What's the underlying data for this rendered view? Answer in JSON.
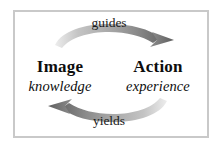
{
  "figure": {
    "type": "cycle-diagram",
    "background_color": "#ffffff",
    "frame": {
      "border_color": "#c9c9c9",
      "fill_color": "#ffffff"
    },
    "nodes": [
      {
        "id": "image",
        "title": "Image",
        "subtitle": "knowledge",
        "position": "left"
      },
      {
        "id": "action",
        "title": "Action",
        "subtitle": "experience",
        "position": "right"
      }
    ],
    "edges": [
      {
        "id": "guides",
        "label": "guides",
        "from": "image",
        "to": "action",
        "position": "top",
        "direction": "left-to-right",
        "arrow_color_light": "#e0e0e0",
        "arrow_color_dark": "#6e6e6e"
      },
      {
        "id": "yields",
        "label": "yields",
        "from": "action",
        "to": "image",
        "position": "bottom",
        "direction": "right-to-left",
        "arrow_color_light": "#e0e0e0",
        "arrow_color_dark": "#6e6e6e"
      }
    ]
  },
  "colors": {
    "text": "#0d0d0d",
    "edge_text": "#1a1a1a",
    "frame_border": "#c9c9c9",
    "arrow_dark": "#6e6e6e",
    "arrow_mid": "#9a9a9a",
    "arrow_light": "#dcdcdc"
  }
}
